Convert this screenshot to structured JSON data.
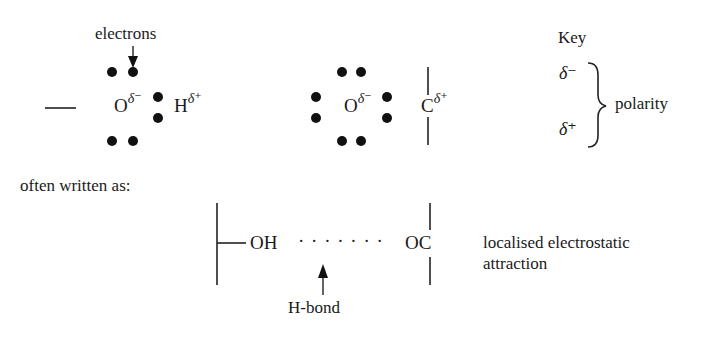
{
  "water_molecule": {
    "electrons_label": "electrons",
    "oxygen": "O",
    "oxygen_charge": "δ⁻",
    "hydrogen": "H",
    "hydrogen_charge": "δ⁺"
  },
  "carbonyl": {
    "oxygen": "O",
    "oxygen_charge": "δ⁻",
    "carbon": "C",
    "carbon_charge": "δ⁺"
  },
  "key": {
    "title": "Key",
    "delta_minus": "δ⁻",
    "delta_plus": "δ⁺",
    "meaning": "polarity"
  },
  "shorthand": {
    "intro": "often written as:",
    "donor": "OH",
    "bond_dots": "· · · · · · ·",
    "acceptor": "OC",
    "bond_label": "H-bond",
    "description_line1": "localised electrostatic",
    "description_line2": "attraction"
  }
}
